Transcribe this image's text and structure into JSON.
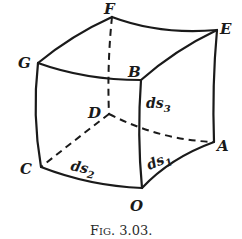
{
  "figure": {
    "vertex_labels": {
      "F": "F",
      "E": "E",
      "G": "G",
      "B": "B",
      "D": "D",
      "A": "A",
      "C": "C",
      "O": "O"
    },
    "edge_labels": {
      "ds1": {
        "base": "ds",
        "sub": "1"
      },
      "ds2": {
        "base": "ds",
        "sub": "2"
      },
      "ds3": {
        "base": "ds",
        "sub": "3"
      }
    },
    "caption": "Fig. 3.03.",
    "caption_parts": {
      "prefix_big": "F",
      "prefix_small": "IG",
      "suffix": ". 3.03."
    }
  }
}
